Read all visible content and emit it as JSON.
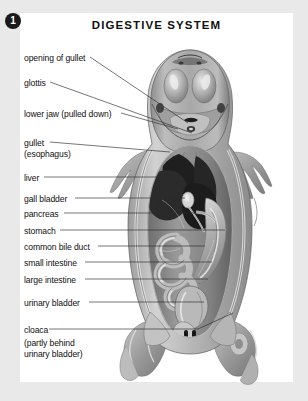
{
  "figure": {
    "number": "1",
    "title": "DIGESTIVE SYSTEM"
  },
  "colors": {
    "page_background": "#e9e9e9",
    "plate_background": "#ffffff",
    "text": "#111111",
    "badge_background": "#1a1a1a",
    "badge_text": "#ffffff",
    "leader_line": "#2b2b2b",
    "specimen_dark": "#2a2a2a",
    "specimen_mid": "#8b8b8b",
    "specimen_light": "#cfcfcf"
  },
  "labels": [
    {
      "id": "opening-of-gullet",
      "text": "opening of gullet",
      "x": 24,
      "y": 53,
      "dash_x": 90,
      "dash_y": 57,
      "target_x": 188,
      "target_y": 123
    },
    {
      "id": "glottis",
      "text": "glottis",
      "x": 24,
      "y": 78,
      "dash_x": 50,
      "dash_y": 82,
      "target_x": 192,
      "target_y": 133
    },
    {
      "id": "lower-jaw",
      "text": "lower jaw (pulled down)",
      "x": 24,
      "y": 109,
      "dash_x": 121,
      "dash_y": 113,
      "target_x": 178,
      "target_y": 129
    },
    {
      "id": "gullet",
      "text": "gullet",
      "x": 24,
      "y": 138,
      "dash_x": 50,
      "dash_y": 142,
      "target_x": 170,
      "target_y": 152
    },
    {
      "id": "gullet-esophagus",
      "text": "(esophagus)",
      "x": 24,
      "y": 149,
      "dash_x": null,
      "dash_y": null,
      "target_x": null,
      "target_y": null
    },
    {
      "id": "liver",
      "text": "liver",
      "x": 24,
      "y": 173,
      "dash_x": 44,
      "dash_y": 177,
      "target_x": 178,
      "target_y": 177
    },
    {
      "id": "gall-bladder",
      "text": "gall bladder",
      "x": 24,
      "y": 194,
      "dash_x": 75,
      "dash_y": 198,
      "target_x": 185,
      "target_y": 198
    },
    {
      "id": "pancreas",
      "text": "pancreas",
      "x": 24,
      "y": 209,
      "dash_x": 64,
      "dash_y": 213,
      "target_x": 196,
      "target_y": 213
    },
    {
      "id": "stomach",
      "text": "stomach",
      "x": 24,
      "y": 226,
      "dash_x": 60,
      "dash_y": 230,
      "target_x": 225,
      "target_y": 230
    },
    {
      "id": "common-bile-duct",
      "text": "common bile duct",
      "x": 24,
      "y": 242,
      "dash_x": 98,
      "dash_y": 246,
      "target_x": 205,
      "target_y": 246
    },
    {
      "id": "small-intestine",
      "text": "small intestine",
      "x": 24,
      "y": 258,
      "dash_x": 85,
      "dash_y": 262,
      "target_x": 212,
      "target_y": 262
    },
    {
      "id": "large-intestine",
      "text": "large intestine",
      "x": 24,
      "y": 275,
      "dash_x": 85,
      "dash_y": 279,
      "target_x": 208,
      "target_y": 279
    },
    {
      "id": "urinary-bladder",
      "text": "urinary bladder",
      "x": 24,
      "y": 298,
      "dash_x": 89,
      "dash_y": 302,
      "target_x": 204,
      "target_y": 302
    },
    {
      "id": "cloaca",
      "text": "cloaca",
      "x": 24,
      "y": 325,
      "dash_x": 49,
      "dash_y": 329,
      "target_x": 198,
      "target_y": 329
    },
    {
      "id": "cloaca-note-1",
      "text": "(partly behind",
      "x": 24,
      "y": 338,
      "dash_x": null,
      "dash_y": null,
      "target_x": null,
      "target_y": null
    },
    {
      "id": "cloaca-note-2",
      "text": "urinary bladder)",
      "x": 24,
      "y": 349,
      "dash_x": null,
      "dash_y": null,
      "target_x": null,
      "target_y": null
    }
  ]
}
